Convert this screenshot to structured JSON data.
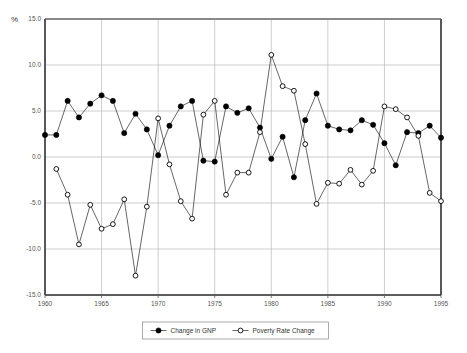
{
  "chart_data": {
    "type": "line",
    "title": "",
    "subtitle": "",
    "xlabel": "",
    "ylabel": "%",
    "yunit_label": "%",
    "xlim": [
      1960,
      1995
    ],
    "ylim": [
      -15.0,
      15.0
    ],
    "ytick_step": 5.0,
    "xtick_step": 5,
    "grid": true,
    "legend_position": "bottom-center",
    "x": [
      1960,
      1961,
      1962,
      1963,
      1964,
      1965,
      1966,
      1967,
      1968,
      1969,
      1970,
      1971,
      1972,
      1973,
      1974,
      1975,
      1976,
      1977,
      1978,
      1979,
      1980,
      1981,
      1982,
      1983,
      1984,
      1985,
      1986,
      1987,
      1988,
      1989,
      1990,
      1991,
      1992,
      1993,
      1994,
      1995
    ],
    "xtick_labels": [
      "1960",
      "1965",
      "1970",
      "1975",
      "1980",
      "1985",
      "1990",
      "1995"
    ],
    "ytick_labels": [
      "15.0",
      "10.0",
      "5.0",
      "0.0",
      "-5.0",
      "-10.0",
      "-15.0"
    ],
    "series": [
      {
        "name": "Change in GNP",
        "marker": "filled-circle",
        "color": "#000000",
        "values": [
          2.4,
          2.4,
          6.1,
          4.3,
          5.8,
          6.7,
          6.1,
          2.6,
          4.7,
          3.0,
          0.2,
          3.4,
          5.5,
          6.1,
          -0.4,
          -0.5,
          5.5,
          4.8,
          5.3,
          3.2,
          -0.2,
          2.2,
          -2.2,
          4.0,
          6.9,
          3.4,
          3.0,
          2.9,
          4.0,
          3.5,
          1.5,
          -0.9,
          2.7,
          2.6,
          3.4,
          2.1
        ]
      },
      {
        "name": "Poverty Rate Change",
        "marker": "open-circle",
        "color": "#000000",
        "values": [
          null,
          -1.3,
          -4.1,
          -9.5,
          -5.2,
          -7.8,
          -7.3,
          -4.6,
          -12.9,
          -5.4,
          4.2,
          -0.8,
          -4.8,
          -6.7,
          4.6,
          6.1,
          -4.1,
          -1.7,
          -1.7,
          2.7,
          11.1,
          7.7,
          7.2,
          1.4,
          -5.1,
          -2.8,
          -2.9,
          -1.4,
          -3.0,
          -1.5,
          5.5,
          5.2,
          4.3,
          2.3,
          -3.9,
          -4.8
        ]
      }
    ],
    "legend": [
      {
        "label": "Change in GNP",
        "marker": "filled-circle"
      },
      {
        "label": "Poverty Rate Change",
        "marker": "open-circle"
      }
    ]
  }
}
